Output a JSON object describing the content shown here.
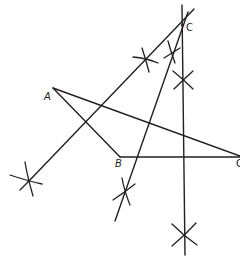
{
  "diagram": {
    "type": "geometric-construction",
    "stroke_color": "#231f20",
    "background": "#ffffff",
    "points": [
      {
        "id": "A",
        "label": "A",
        "x": 53,
        "y": 88
      },
      {
        "id": "B",
        "label": "B",
        "x": 120,
        "y": 157
      },
      {
        "id": "C",
        "label": "C",
        "x": 182,
        "y": 25
      },
      {
        "id": "D",
        "label": "C",
        "x": 240,
        "y": 156
      }
    ],
    "labels": {
      "A": "A",
      "B": "B",
      "C": "C",
      "D": "C"
    },
    "segments": [
      {
        "name": "A-B",
        "from": [
          53,
          88
        ],
        "to": [
          120,
          157
        ]
      },
      {
        "name": "B-D",
        "from": [
          120,
          157
        ],
        "to": [
          240,
          157
        ]
      },
      {
        "name": "A-D",
        "from": [
          53,
          88
        ],
        "to": [
          240,
          156
        ]
      },
      {
        "name": "C-line-left",
        "from": [
          194,
          9
        ],
        "to": [
          28,
          182
        ]
      },
      {
        "name": "C-line-middle",
        "from": [
          188,
          12
        ],
        "to": [
          115,
          221
        ]
      },
      {
        "name": "vertical-line",
        "from": [
          182,
          5
        ],
        "to": [
          185,
          255
        ]
      }
    ],
    "construction_marks": [
      {
        "name": "cross-top-left",
        "x": 146,
        "y": 60
      },
      {
        "name": "cross-top-middle",
        "x": 172,
        "y": 52
      },
      {
        "name": "cross-top-vertical",
        "x": 183,
        "y": 80
      },
      {
        "name": "cross-bottom-left",
        "x": 28,
        "y": 182
      },
      {
        "name": "cross-bottom-middle",
        "x": 125,
        "y": 192
      },
      {
        "name": "cross-bottom-vertical",
        "x": 184,
        "y": 236
      }
    ]
  }
}
